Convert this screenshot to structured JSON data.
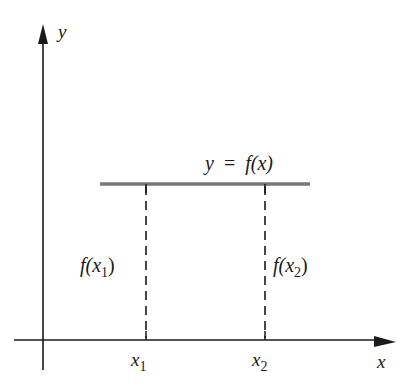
{
  "diagram": {
    "title_fragment": "(ƒ)",
    "axes": {
      "x_label": "x",
      "y_label": "y"
    },
    "function_label": {
      "lhs": "y",
      "eq": "=",
      "rhs": "f(x)"
    },
    "points": [
      {
        "tick_label_base": "x",
        "tick_label_sub": "1",
        "value_label_prefix": "f(x",
        "value_label_sub": "1",
        "value_label_suffix": ")"
      },
      {
        "tick_label_base": "x",
        "tick_label_sub": "2",
        "value_label_prefix": "f(x",
        "value_label_sub": "2",
        "value_label_suffix": ")"
      }
    ],
    "colors": {
      "axis": "#1a1a1a",
      "function_line": "#777777",
      "dashed": "#1a1a1a"
    }
  }
}
